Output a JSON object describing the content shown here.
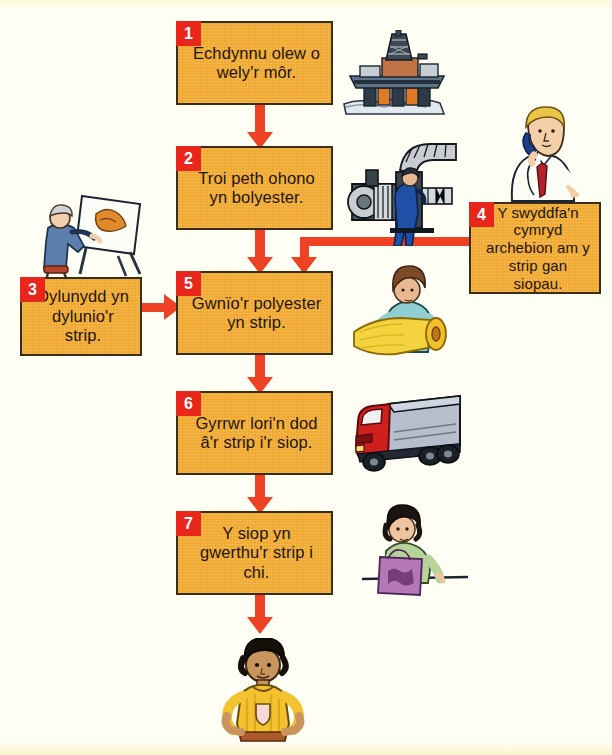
{
  "diagram": {
    "language": "cy",
    "background_color": "#fffef5",
    "box_color": "#f0a82e",
    "badge_color": "#e8261c",
    "arrow_color": "#ef4123",
    "steps": [
      {
        "number": "1",
        "text": "Echdynnu olew o wely'r môr.",
        "illustration": "oil-rig-icon"
      },
      {
        "number": "2",
        "text": "Troi peth ohono yn bolyester.",
        "illustration": "factory-machine-worker-icon"
      },
      {
        "number": "3",
        "text": "Dylunydd yn dylunio'r strip.",
        "illustration": "designer-at-drawing-board-icon"
      },
      {
        "number": "4",
        "text": "Y swyddfa'n cymryd archebion am y strip gan siopau.",
        "illustration": "office-worker-on-phone-icon"
      },
      {
        "number": "5",
        "text": "Gwnïo'r polyester yn strip.",
        "illustration": "woman-with-fabric-roll-icon"
      },
      {
        "number": "6",
        "text": "Gyrrwr lori'n dod â'r strip i'r siop.",
        "illustration": "delivery-lorry-icon"
      },
      {
        "number": "7",
        "text": "Y siop yn gwerthu'r strip i chi.",
        "illustration": "shop-assistant-with-bag-icon"
      }
    ],
    "final_illustration": "boy-wearing-strip-icon"
  }
}
